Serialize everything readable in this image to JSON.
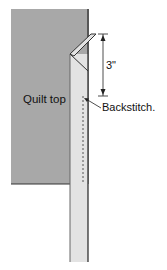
{
  "diagram": {
    "labels": {
      "quilt_top": "Quilt top",
      "measurement": "3\"",
      "backstitch": "Backstitch."
    },
    "colors": {
      "quilt_top_fill": "#a8a8a8",
      "binding_fill": "#e3e3e3",
      "outline": "#2a2a2a",
      "background": "#ffffff"
    }
  }
}
